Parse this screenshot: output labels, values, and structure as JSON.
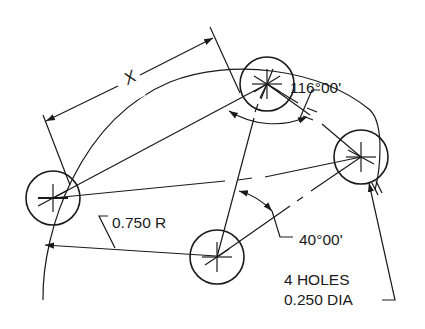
{
  "figure": {
    "type": "technical-drawing",
    "line_color": "#1a1a1a",
    "background": "#ffffff"
  },
  "holes": {
    "count": 4,
    "diameter": "0.250",
    "positions": [
      {
        "id": "A",
        "cx": 53,
        "cy": 198
      },
      {
        "id": "B",
        "cx": 267,
        "cy": 84
      },
      {
        "id": "C",
        "cx": 361,
        "cy": 157
      },
      {
        "id": "D",
        "cx": 217,
        "cy": 257
      }
    ]
  },
  "dimensions": {
    "chord_label": "X",
    "angle_large": "116°00'",
    "angle_small": "40°00'",
    "radius": "0.750 R",
    "hole_note_line1": "4 HOLES",
    "hole_note_line2": "0.250 DIA"
  }
}
